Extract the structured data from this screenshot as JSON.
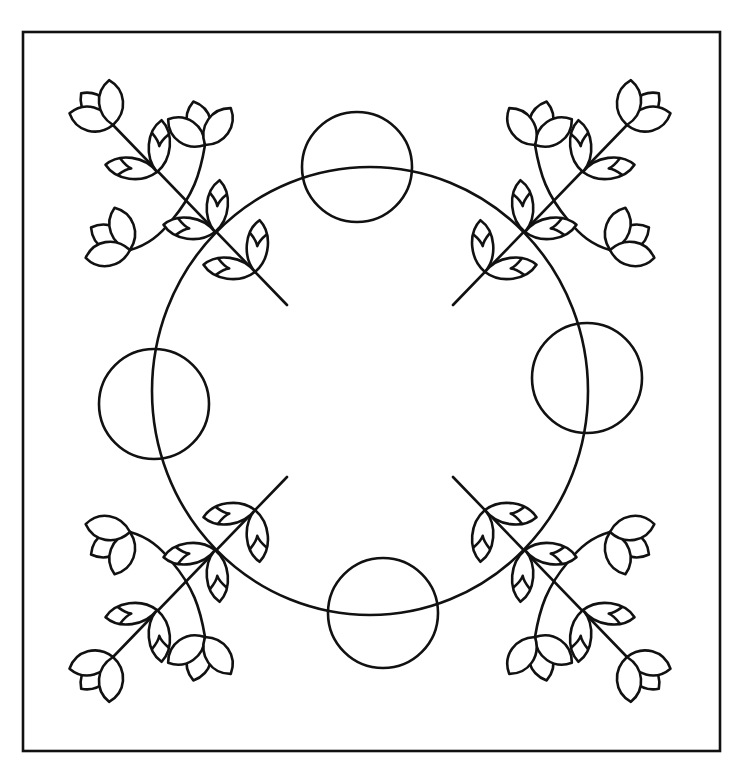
{
  "artwork": {
    "description": "Quilt block line-art pattern: square frame, large central circle, four small circles on cardinal points, four mirrored tulip-and-leaf branches in the corners",
    "colors": {
      "background": "#ffffff",
      "line": "#111111"
    },
    "frame": {
      "x": 23,
      "y": 32,
      "width": 697,
      "height": 719
    },
    "center_circle": {
      "cx": 370,
      "cy": 391,
      "rx": 218,
      "ry": 224
    },
    "small_circles": [
      {
        "name": "top",
        "cx": 357,
        "cy": 167,
        "r": 55
      },
      {
        "name": "left",
        "cx": 154,
        "cy": 404,
        "r": 55
      },
      {
        "name": "right",
        "cx": 587,
        "cy": 378,
        "r": 55
      },
      {
        "name": "bottom",
        "cx": 383,
        "cy": 613,
        "r": 55
      }
    ],
    "corner_branches": [
      "top-left",
      "top-right",
      "bottom-left",
      "bottom-right"
    ],
    "branch_elements": {
      "tulips_per_corner": 3,
      "leaf_pairs_per_corner": 3
    }
  }
}
